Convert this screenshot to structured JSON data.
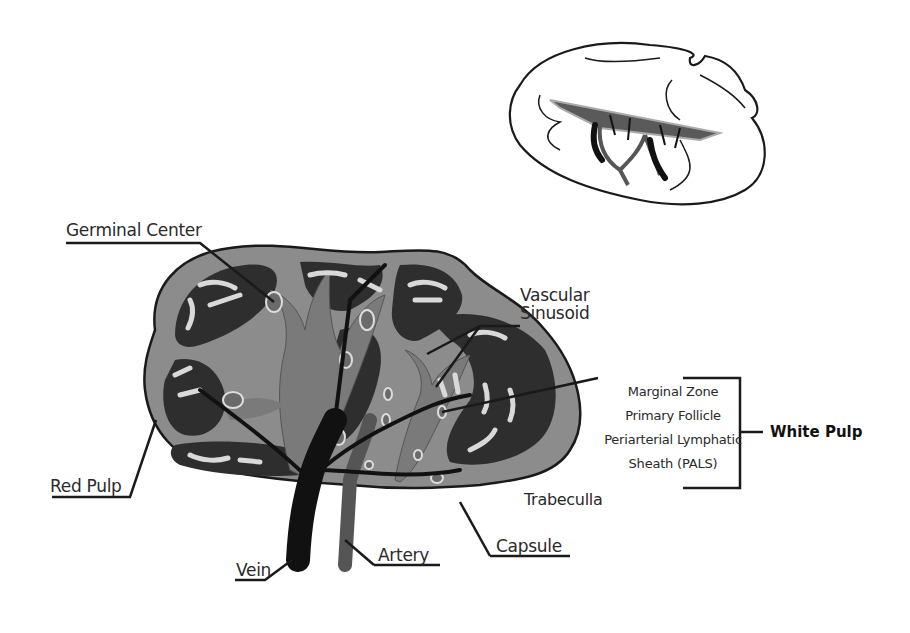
{
  "diagram": {
    "labels": {
      "germinal_center": "Germinal Center",
      "vascular_sinusoid_line1": "Vascular",
      "vascular_sinusoid_line2": "Sinusoid",
      "red_pulp": "Red Pulp",
      "trabeculla": "Trabeculla",
      "capsule": "Capsule",
      "vein": "Vein",
      "artery": "Artery"
    },
    "white_pulp": {
      "title": "White Pulp",
      "components": [
        "Marginal Zone",
        "Primary Follicle",
        "Periarterial Lymphatic",
        "Sheath (PALS)"
      ]
    },
    "colors": {
      "outline": "#1a1a1a",
      "capsule_fill": "#8c8c8c",
      "red_pulp_fill": "#2e2e2e",
      "white_pulp_fill": "#7a7a7a",
      "sinusoid_fill": "#d9d9d9",
      "vein_fill": "#111111",
      "artery_fill": "#555555"
    }
  }
}
